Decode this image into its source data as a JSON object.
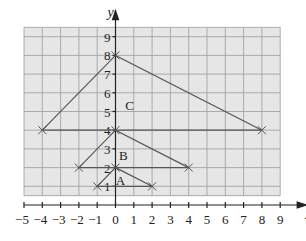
{
  "chart_data": {
    "type": "diagram",
    "title": "",
    "xlabel": "x",
    "ylabel": "y",
    "xlim": [
      -5,
      9
    ],
    "ylim": [
      0,
      9
    ],
    "grid": true,
    "x_ticks": [
      "−5",
      "−4",
      "−3",
      "−2",
      "−1",
      "0",
      "1",
      "2",
      "3",
      "4",
      "5",
      "6",
      "7",
      "8",
      "9"
    ],
    "y_ticks": [
      "1",
      "2",
      "3",
      "4",
      "5",
      "6",
      "7",
      "8",
      "9"
    ],
    "shapes": [
      {
        "label": "A",
        "vertices": [
          [
            -1,
            1
          ],
          [
            0,
            2
          ],
          [
            2,
            1
          ]
        ]
      },
      {
        "label": "B",
        "vertices": [
          [
            -2,
            2
          ],
          [
            0,
            4
          ],
          [
            4,
            2
          ]
        ]
      },
      {
        "label": "C",
        "vertices": [
          [
            -4,
            4
          ],
          [
            0,
            8
          ],
          [
            8,
            4
          ]
        ]
      }
    ]
  },
  "colors": {
    "grid_fill": "#e6e6e6",
    "grid_line": "#9a9a9a",
    "shape_line": "#555555",
    "axis": "#222222"
  }
}
